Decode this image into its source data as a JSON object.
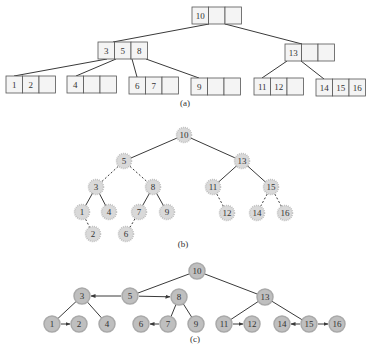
{
  "figure": {
    "captions": {
      "a": "(a)",
      "b": "(b)",
      "c": "(c)"
    },
    "colors": {
      "line": "#3a3a3a",
      "box_border": "#555555",
      "box_fill": "#f4f4f4",
      "node_fill_b": "#d9d9d9",
      "node_ring_b": "#bdbdbd",
      "node_fill_c": "#bfbfbf",
      "node_ring_c": "#a9a9a9",
      "text": "#333333"
    }
  },
  "tree_a": {
    "description": "2-3-4 tree (B-tree) with nodes as 3-cell boxes",
    "cell_w": 16.5,
    "cell_h": 17,
    "nodes": [
      {
        "id": "root",
        "x": 192,
        "y": 7,
        "keys": [
          "10",
          "",
          ""
        ]
      },
      {
        "id": "n358",
        "x": 98,
        "y": 42,
        "keys": [
          "3",
          "5",
          "8"
        ]
      },
      {
        "id": "n13",
        "x": 285,
        "y": 44,
        "keys": [
          "13",
          "",
          ""
        ]
      },
      {
        "id": "l12",
        "x": 6,
        "y": 76,
        "keys": [
          "1",
          "2",
          ""
        ]
      },
      {
        "id": "l4",
        "x": 67,
        "y": 76,
        "keys": [
          "4",
          "",
          ""
        ]
      },
      {
        "id": "l67",
        "x": 129,
        "y": 77,
        "keys": [
          "6",
          "7",
          ""
        ]
      },
      {
        "id": "l9",
        "x": 191,
        "y": 78,
        "keys": [
          "9",
          "",
          ""
        ]
      },
      {
        "id": "l1112",
        "x": 254,
        "y": 78,
        "keys": [
          "11",
          "12",
          ""
        ]
      },
      {
        "id": "l141516",
        "x": 316,
        "y": 79,
        "keys": [
          "14",
          "15",
          "16"
        ]
      }
    ],
    "edges": [
      [
        209,
        24,
        113,
        42
      ],
      [
        225,
        24,
        302,
        44
      ],
      [
        107,
        59,
        14,
        76
      ],
      [
        116,
        59,
        76,
        76
      ],
      [
        132,
        59,
        137,
        77
      ],
      [
        146,
        59,
        199,
        78
      ],
      [
        287,
        61,
        262,
        78
      ],
      [
        301,
        61,
        324,
        79
      ]
    ],
    "caption_pos": [
      185,
      106
    ]
  },
  "tree_b": {
    "description": "Red-black style binary tree; dashed edges are red links",
    "radius": 7.5,
    "nodes": [
      {
        "key": "10",
        "x": 184,
        "y": 135
      },
      {
        "key": "5",
        "x": 124,
        "y": 161
      },
      {
        "key": "13",
        "x": 242,
        "y": 161
      },
      {
        "key": "3",
        "x": 96,
        "y": 187
      },
      {
        "key": "8",
        "x": 153,
        "y": 187
      },
      {
        "key": "11",
        "x": 213,
        "y": 187
      },
      {
        "key": "15",
        "x": 271,
        "y": 187
      },
      {
        "key": "1",
        "x": 82,
        "y": 212
      },
      {
        "key": "4",
        "x": 109,
        "y": 212
      },
      {
        "key": "7",
        "x": 139,
        "y": 212
      },
      {
        "key": "9",
        "x": 167,
        "y": 212
      },
      {
        "key": "12",
        "x": 227,
        "y": 213
      },
      {
        "key": "14",
        "x": 257,
        "y": 213
      },
      {
        "key": "16",
        "x": 285,
        "y": 213
      },
      {
        "key": "2",
        "x": 93,
        "y": 234
      },
      {
        "key": "6",
        "x": 126,
        "y": 234
      }
    ],
    "edges": [
      {
        "from": "10",
        "to": "5",
        "dashed": false
      },
      {
        "from": "10",
        "to": "13",
        "dashed": false
      },
      {
        "from": "5",
        "to": "3",
        "dashed": true
      },
      {
        "from": "5",
        "to": "8",
        "dashed": true
      },
      {
        "from": "13",
        "to": "11",
        "dashed": false
      },
      {
        "from": "13",
        "to": "15",
        "dashed": false
      },
      {
        "from": "3",
        "to": "1",
        "dashed": false
      },
      {
        "from": "3",
        "to": "4",
        "dashed": false
      },
      {
        "from": "8",
        "to": "7",
        "dashed": false
      },
      {
        "from": "8",
        "to": "9",
        "dashed": false
      },
      {
        "from": "11",
        "to": "12",
        "dashed": true
      },
      {
        "from": "15",
        "to": "14",
        "dashed": true
      },
      {
        "from": "15",
        "to": "16",
        "dashed": true
      },
      {
        "from": "1",
        "to": "2",
        "dashed": true
      },
      {
        "from": "7",
        "to": "6",
        "dashed": true
      }
    ],
    "caption_pos": [
      183,
      247
    ]
  },
  "tree_c": {
    "description": "Horizontal links (arrows) represent red links flattened",
    "radius": 8,
    "nodes": [
      {
        "key": "10",
        "x": 197,
        "y": 271
      },
      {
        "key": "3",
        "x": 82,
        "y": 296
      },
      {
        "key": "5",
        "x": 130,
        "y": 296
      },
      {
        "key": "8",
        "x": 179,
        "y": 297
      },
      {
        "key": "13",
        "x": 265,
        "y": 297
      },
      {
        "key": "1",
        "x": 52,
        "y": 324
      },
      {
        "key": "2",
        "x": 79,
        "y": 324
      },
      {
        "key": "4",
        "x": 107,
        "y": 324
      },
      {
        "key": "6",
        "x": 141,
        "y": 324
      },
      {
        "key": "7",
        "x": 168,
        "y": 324
      },
      {
        "key": "9",
        "x": 196,
        "y": 324
      },
      {
        "key": "11",
        "x": 224,
        "y": 324
      },
      {
        "key": "12",
        "x": 252,
        "y": 324
      },
      {
        "key": "14",
        "x": 282,
        "y": 324
      },
      {
        "key": "15",
        "x": 309,
        "y": 324
      },
      {
        "key": "16",
        "x": 337,
        "y": 324
      }
    ],
    "edges": [
      {
        "from": "10",
        "to": "5",
        "arrow": false
      },
      {
        "from": "10",
        "to": "13",
        "arrow": false
      },
      {
        "from": "5",
        "to": "3",
        "arrow": true
      },
      {
        "from": "5",
        "to": "8",
        "arrow": true
      },
      {
        "from": "3",
        "to": "1",
        "arrow": false
      },
      {
        "from": "3",
        "to": "4",
        "arrow": false
      },
      {
        "from": "8",
        "to": "7",
        "arrow": false
      },
      {
        "from": "8",
        "to": "9",
        "arrow": false
      },
      {
        "from": "13",
        "to": "11",
        "arrow": false
      },
      {
        "from": "13",
        "to": "15",
        "arrow": false
      },
      {
        "from": "1",
        "to": "2",
        "arrow": true
      },
      {
        "from": "7",
        "to": "6",
        "arrow": true
      },
      {
        "from": "11",
        "to": "12",
        "arrow": true
      },
      {
        "from": "15",
        "to": "14",
        "arrow": true
      },
      {
        "from": "15",
        "to": "16",
        "arrow": true
      }
    ],
    "caption_pos": [
      195,
      342
    ]
  }
}
